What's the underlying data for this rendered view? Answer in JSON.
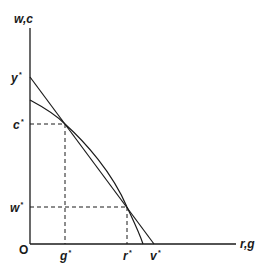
{
  "diagram": {
    "type": "economic-frontier",
    "axes": {
      "y_label": "w,c",
      "x_label": "r,g",
      "origin_label": "O"
    },
    "y_ticks": [
      {
        "label": "y",
        "star": "*",
        "y": 77
      },
      {
        "label": "c",
        "star": "*",
        "y": 124
      },
      {
        "label": "w",
        "star": "*",
        "y": 207
      }
    ],
    "x_ticks": [
      {
        "label": "g",
        "star": "*",
        "x": 65
      },
      {
        "label": "r",
        "star": "*",
        "x": 127
      },
      {
        "label": "v",
        "star": "*",
        "x": 154
      }
    ],
    "curves": [
      {
        "name": "straight-line",
        "from": "y*",
        "to": "v*"
      },
      {
        "name": "concave-frontier",
        "from_y_intercept": "below y*",
        "to_x_intercept": "between r* and v*"
      }
    ],
    "intersections": [
      {
        "name": "g*-c*",
        "x": "g*",
        "y": "c*"
      },
      {
        "name": "r*-w*",
        "x": "r*",
        "y": "w*"
      }
    ],
    "colors": {
      "line": "#1a1a1a",
      "background": "#ffffff"
    }
  }
}
